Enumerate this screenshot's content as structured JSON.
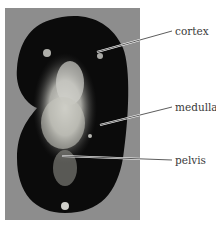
{
  "figure": {
    "background_color": "#8d8d8d",
    "labels": [
      {
        "text": "cortex"
      },
      {
        "text": "medulla"
      },
      {
        "text": "pelvis"
      }
    ]
  }
}
